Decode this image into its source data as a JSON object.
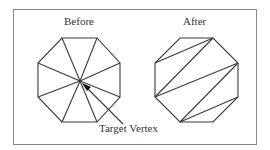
{
  "diagram": {
    "title_before": "Before",
    "title_after": "After",
    "annotation": "Target Vertex",
    "colors": {
      "stroke": "#3a3a3a",
      "frame": "#8a8a8a",
      "background": "#ffffff"
    },
    "before_octagon": {
      "vertices": [
        [
          62,
          38
        ],
        [
          97,
          38
        ],
        [
          120,
          63
        ],
        [
          120,
          97
        ],
        [
          97,
          122
        ],
        [
          62,
          122
        ],
        [
          38,
          97
        ],
        [
          38,
          63
        ]
      ],
      "target_vertex": [
        80,
        81
      ],
      "fan_edges": "all vertices connected to the target vertex"
    },
    "after_octagon": {
      "vertices": [
        [
          180,
          38
        ],
        [
          213,
          38
        ],
        [
          238,
          63
        ],
        [
          238,
          97
        ],
        [
          213,
          122
        ],
        [
          180,
          122
        ],
        [
          155,
          97
        ],
        [
          155,
          63
        ]
      ],
      "diagonals": [
        [
          [
            155,
            63
          ],
          [
            213,
            38
          ]
        ],
        [
          [
            155,
            97
          ],
          [
            213,
            38
          ]
        ],
        [
          [
            155,
            97
          ],
          [
            238,
            63
          ]
        ],
        [
          [
            180,
            122
          ],
          [
            238,
            63
          ]
        ],
        [
          [
            180,
            122
          ],
          [
            238,
            97
          ]
        ]
      ]
    }
  }
}
